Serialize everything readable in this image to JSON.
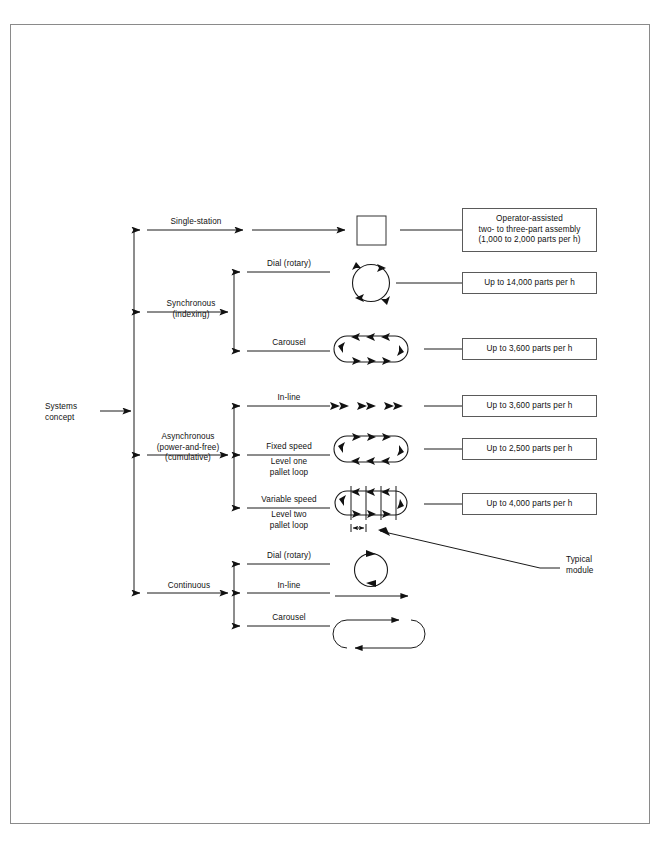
{
  "page": {
    "frame": {
      "visible": true,
      "color": "#8a8a8a"
    },
    "background": "#ffffff",
    "line_color": "#1a1a1a"
  },
  "root": {
    "label_line1": "Systems",
    "label_line2": "concept"
  },
  "branches": [
    {
      "id": "single-station",
      "label": "Single-station",
      "symbol": "square",
      "note_index": 0
    },
    {
      "id": "synchronous",
      "label_line1": "Synchronous",
      "label_line2": "(indexing)",
      "children": [
        {
          "id": "synchronous-dial",
          "label": "Dial (rotary)",
          "symbol": "circle-arrows",
          "note_index": 1
        },
        {
          "id": "synchronous-carousel",
          "label": "Carousel",
          "symbol": "stadium-arrows",
          "note_index": 2
        }
      ]
    },
    {
      "id": "asynchronous",
      "label_line1": "Asynchronous",
      "label_line2": "(power-and-free)",
      "label_line3": "(cumulative)",
      "children": [
        {
          "id": "asynchronous-inline",
          "label": "In-line",
          "symbol": "arrow-triplets",
          "note_index": 3
        },
        {
          "id": "asynchronous-fixed-speed",
          "label_above": "Fixed speed",
          "label_below_line1": "Level one",
          "label_below_line2": "pallet loop",
          "symbol": "stadium-arrows",
          "note_index": 4
        },
        {
          "id": "asynchronous-variable-speed",
          "label_above": "Variable speed",
          "label_below_line1": "Level two",
          "label_below_line2": "pallet loop",
          "symbol": "stadium-modules",
          "note_index": 5
        }
      ]
    },
    {
      "id": "continuous",
      "label": "Continuous",
      "children": [
        {
          "id": "continuous-dial",
          "label": "Dial (rotary)",
          "symbol": "circle-plain"
        },
        {
          "id": "continuous-inline",
          "label": "In-line",
          "symbol": "straight-arrow"
        },
        {
          "id": "continuous-carousel",
          "label": "Carousel",
          "symbol": "stadium-plain"
        }
      ]
    }
  ],
  "notes": [
    {
      "id": "note-operator-assisted",
      "lines": [
        "Operator-assisted",
        "two- to three-part assembly",
        "(1,000 to 2,000 parts per h)"
      ]
    },
    {
      "id": "note-14000",
      "lines": [
        "Up to 14,000 parts per h"
      ]
    },
    {
      "id": "note-3600-carousel",
      "lines": [
        "Up to 3,600 parts per h"
      ]
    },
    {
      "id": "note-3600-inline",
      "lines": [
        "Up to 3,600 parts per h"
      ]
    },
    {
      "id": "note-2500",
      "lines": [
        "Up to 2,500 parts per h"
      ]
    },
    {
      "id": "note-4000",
      "lines": [
        "Up to 4,000 parts per h"
      ]
    }
  ],
  "callout": {
    "id": "typical-module",
    "line1": "Typical",
    "line2": "module"
  }
}
